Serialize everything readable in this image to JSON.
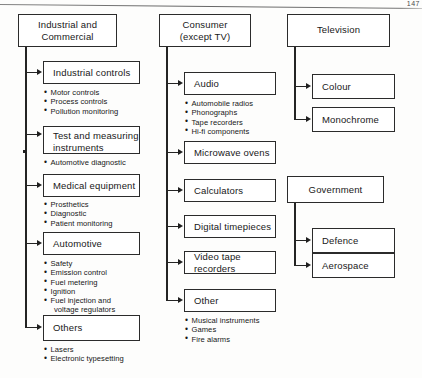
{
  "page": {
    "number": "147"
  },
  "diagram": {
    "type": "hierarchy-tree",
    "columns": [
      {
        "id": "industrial-and-commercial",
        "root": "Industrial and\nCommercial",
        "children": [
          {
            "id": "industrial-controls",
            "label": "Industrial controls",
            "bullets": [
              "Motor controls",
              "Process controls",
              "Pollution monitoring"
            ]
          },
          {
            "id": "test-and-measuring-instruments",
            "label": "Test and measuring\ninstruments",
            "bullets": [
              "Automotive diagnostic"
            ]
          },
          {
            "id": "medical-equipment",
            "label": "Medical equipment",
            "bullets": [
              "Prosthetics",
              "Diagnostic",
              "Patient monitoring"
            ]
          },
          {
            "id": "automotive",
            "label": "Automotive",
            "bullets": [
              "Safety",
              "Emission control",
              "Fuel metering",
              "Ignition",
              "Fuel injection and",
              "voltage regulators"
            ]
          },
          {
            "id": "others",
            "label": "Others",
            "bullets": [
              "Lasers",
              "Electronic typesetting"
            ]
          }
        ]
      },
      {
        "id": "consumer-except-tv",
        "root": "Consumer\n(except TV)",
        "children": [
          {
            "id": "audio",
            "label": "Audio",
            "bullets": [
              "Automobile radios",
              "Phonographs",
              "Tape recorders",
              "Hi-fi components"
            ]
          },
          {
            "id": "microwave-ovens",
            "label": "Microwave ovens",
            "bullets": []
          },
          {
            "id": "calculators",
            "label": "Calculators",
            "bullets": []
          },
          {
            "id": "digital-timepieces",
            "label": "Digital timepieces",
            "bullets": []
          },
          {
            "id": "video-tape-recorders",
            "label": "Video tape recorders",
            "bullets": []
          },
          {
            "id": "other",
            "label": "Other",
            "bullets": [
              "Musical instruments",
              "Games",
              "Fire alarms"
            ]
          }
        ]
      },
      {
        "id": "television",
        "root": "Television",
        "children": [
          {
            "id": "colour",
            "label": "Colour",
            "bullets": []
          },
          {
            "id": "monochrome",
            "label": "Monochrome",
            "bullets": []
          }
        ]
      },
      {
        "id": "government",
        "root": "Government",
        "children": [
          {
            "id": "defence",
            "label": "Defence",
            "bullets": []
          },
          {
            "id": "aerospace",
            "label": "Aerospace",
            "bullets": []
          }
        ]
      }
    ]
  }
}
